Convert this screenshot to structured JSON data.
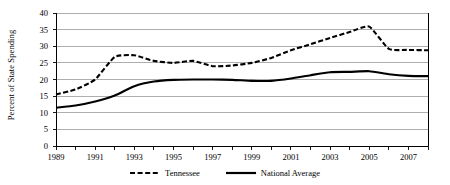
{
  "chart_data": {
    "type": "line",
    "title": "",
    "xlabel": "",
    "ylabel": "Percent of State Spending",
    "xlim": [
      1989,
      2008
    ],
    "ylim": [
      0,
      40
    ],
    "ytick_step": 5,
    "grid": "horizontal",
    "legend_position": "bottom",
    "yticks": [
      "0",
      "5",
      "10",
      "15",
      "20",
      "25",
      "30",
      "35",
      "40"
    ],
    "xticks": [
      1989,
      1990,
      1991,
      1992,
      1993,
      1994,
      1995,
      1996,
      1997,
      1998,
      1999,
      2000,
      2001,
      2002,
      2003,
      2004,
      2005,
      2006,
      2007,
      2008
    ],
    "xtick_labels": [
      "1989",
      "",
      "1991",
      "",
      "1993",
      "",
      "1995",
      "",
      "1997",
      "",
      "1999",
      "",
      "2001",
      "",
      "2003",
      "",
      "2005",
      "",
      "2007",
      ""
    ],
    "x": [
      1989,
      1990,
      1991,
      1992,
      1993,
      1994,
      1995,
      1996,
      1997,
      1998,
      1999,
      2000,
      2001,
      2002,
      2003,
      2004,
      2005,
      2006,
      2007,
      2008
    ],
    "series": [
      {
        "name": "Tennessee",
        "style": "dashed",
        "color": "#000000",
        "values": [
          15.5,
          17.0,
          20.0,
          26.8,
          27.3,
          25.6,
          25.0,
          25.6,
          24.0,
          24.2,
          25.0,
          26.5,
          28.8,
          30.6,
          32.5,
          34.3,
          35.9,
          29.2,
          28.9,
          28.8
        ]
      },
      {
        "name": "National Average",
        "style": "solid",
        "color": "#000000",
        "values": [
          11.5,
          12.2,
          13.4,
          15.2,
          18.0,
          19.4,
          19.9,
          20.0,
          20.0,
          19.9,
          19.6,
          19.6,
          20.3,
          21.3,
          22.2,
          22.3,
          22.5,
          21.6,
          21.1,
          21.0
        ]
      }
    ]
  },
  "legend": {
    "items": [
      {
        "label": "Tennessee",
        "style": "dashed"
      },
      {
        "label": "National Average",
        "style": "solid"
      }
    ]
  },
  "colors": {
    "axis": "#000000",
    "grid": "#9a9a9a",
    "background": "#ffffff",
    "series": "#000000"
  }
}
